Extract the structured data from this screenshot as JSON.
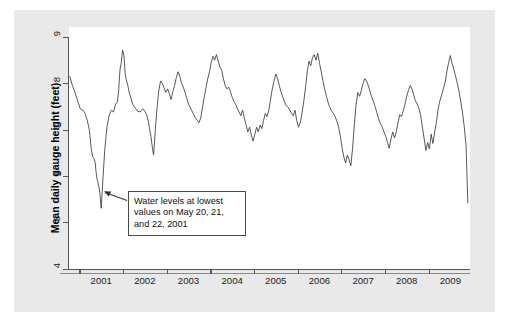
{
  "figure": {
    "background_color": "#e9e9e9",
    "plot_background_color": "#ffffff",
    "line_color": "#3a3a3a",
    "axis_color": "#555555"
  },
  "annotation": {
    "name": "lowest-values-callout",
    "line1": "Water levels at lowest",
    "line2": "values on May 20, 21,",
    "line3": "and 22, 2001",
    "full_text": "Water levels at lowest values on May 20, 21, and 22, 2001",
    "points_to_value": 5.3,
    "points_to_date": "2001-05-21"
  },
  "chart_data": {
    "type": "line",
    "title": "",
    "subtitle": "",
    "xlabel": "",
    "ylabel": "Mean daily gauge height (feet)",
    "ylim": [
      4,
      9
    ],
    "xlim": [
      2000.75,
      2009.95
    ],
    "ytick_labels": [
      "4",
      "5",
      "6",
      "7",
      "8",
      "9"
    ],
    "ytick_values": [
      4,
      5,
      6,
      7,
      8,
      9
    ],
    "xtick_labels": [
      "2001",
      "2002",
      "2003",
      "2004",
      "2005",
      "2006",
      "2007",
      "2008",
      "2009"
    ],
    "xtick_values": [
      2001,
      2002,
      2003,
      2004,
      2005,
      2006,
      2007,
      2008,
      2009
    ],
    "grid": false,
    "legend": "none",
    "series": [
      {
        "name": "Mean daily gauge height",
        "units": "feet",
        "x": [
          2000.78,
          2000.84,
          2000.9,
          2000.96,
          2001.02,
          2001.08,
          2001.13,
          2001.18,
          2001.23,
          2001.27,
          2001.3,
          2001.33,
          2001.36,
          2001.38,
          2001.4,
          2001.42,
          2001.45,
          2001.47,
          2001.5,
          2001.54,
          2001.58,
          2001.63,
          2001.68,
          2001.73,
          2001.78,
          2001.83,
          2001.87,
          2001.9,
          2001.93,
          2001.96,
          2001.99,
          2002.02,
          2002.05,
          2002.08,
          2002.11,
          2002.14,
          2002.18,
          2002.22,
          2002.27,
          2002.33,
          2002.39,
          2002.45,
          2002.5,
          2002.54,
          2002.58,
          2002.61,
          2002.64,
          2002.67,
          2002.7,
          2002.74,
          2002.78,
          2002.82,
          2002.86,
          2002.9,
          2002.94,
          2002.98,
          2003.02,
          2003.06,
          2003.1,
          2003.14,
          2003.18,
          2003.22,
          2003.26,
          2003.3,
          2003.34,
          2003.38,
          2003.42,
          2003.46,
          2003.5,
          2003.54,
          2003.58,
          2003.62,
          2003.66,
          2003.7,
          2003.74,
          2003.78,
          2003.82,
          2003.86,
          2003.9,
          2003.94,
          2003.98,
          2004.02,
          2004.06,
          2004.1,
          2004.14,
          2004.18,
          2004.22,
          2004.26,
          2004.3,
          2004.34,
          2004.38,
          2004.42,
          2004.46,
          2004.5,
          2004.54,
          2004.58,
          2004.62,
          2004.66,
          2004.7,
          2004.74,
          2004.78,
          2004.82,
          2004.86,
          2004.9,
          2004.94,
          2004.98,
          2005.02,
          2005.06,
          2005.1,
          2005.14,
          2005.18,
          2005.22,
          2005.26,
          2005.3,
          2005.34,
          2005.38,
          2005.42,
          2005.46,
          2005.5,
          2005.54,
          2005.58,
          2005.62,
          2005.66,
          2005.7,
          2005.74,
          2005.78,
          2005.82,
          2005.86,
          2005.9,
          2005.94,
          2005.98,
          2006.02,
          2006.06,
          2006.1,
          2006.14,
          2006.18,
          2006.22,
          2006.26,
          2006.3,
          2006.34,
          2006.38,
          2006.42,
          2006.46,
          2006.5,
          2006.54,
          2006.58,
          2006.62,
          2006.66,
          2006.7,
          2006.74,
          2006.78,
          2006.82,
          2006.86,
          2006.9,
          2006.94,
          2006.98,
          2007.02,
          2007.06,
          2007.1,
          2007.14,
          2007.18,
          2007.22,
          2007.26,
          2007.3,
          2007.34,
          2007.38,
          2007.42,
          2007.46,
          2007.5,
          2007.54,
          2007.58,
          2007.62,
          2007.66,
          2007.7,
          2007.74,
          2007.78,
          2007.82,
          2007.86,
          2007.9,
          2007.94,
          2007.98,
          2008.02,
          2008.06,
          2008.1,
          2008.14,
          2008.18,
          2008.22,
          2008.26,
          2008.3,
          2008.34,
          2008.38,
          2008.42,
          2008.46,
          2008.5,
          2008.54,
          2008.58,
          2008.62,
          2008.66,
          2008.7,
          2008.74,
          2008.78,
          2008.82,
          2008.86,
          2008.9,
          2008.94,
          2008.98,
          2009.02,
          2009.06,
          2009.1,
          2009.14,
          2009.18,
          2009.22,
          2009.26,
          2009.3,
          2009.34,
          2009.38,
          2009.42,
          2009.46,
          2009.5,
          2009.54,
          2009.58,
          2009.62,
          2009.66,
          2009.7,
          2009.74,
          2009.78,
          2009.82,
          2009.86,
          2009.9
        ],
        "y": [
          8.15,
          7.95,
          7.8,
          7.62,
          7.45,
          7.42,
          7.35,
          7.2,
          6.98,
          6.6,
          6.42,
          6.38,
          6.3,
          6.1,
          5.95,
          5.88,
          5.75,
          5.62,
          5.3,
          5.95,
          6.55,
          7.05,
          7.3,
          7.42,
          7.38,
          7.55,
          7.6,
          7.85,
          8.3,
          8.45,
          8.72,
          8.6,
          8.2,
          8.05,
          7.95,
          7.8,
          7.68,
          7.55,
          7.48,
          7.4,
          7.38,
          7.45,
          7.4,
          7.32,
          7.18,
          7.0,
          6.85,
          6.62,
          6.45,
          7.0,
          7.48,
          7.85,
          8.05,
          8.0,
          7.9,
          7.8,
          7.88,
          7.78,
          7.65,
          7.82,
          7.95,
          8.12,
          8.25,
          8.15,
          8.0,
          7.92,
          7.8,
          7.68,
          7.55,
          7.48,
          7.4,
          7.32,
          7.25,
          7.2,
          7.15,
          7.25,
          7.48,
          7.7,
          7.9,
          8.1,
          8.25,
          8.45,
          8.58,
          8.5,
          8.62,
          8.48,
          8.35,
          8.28,
          8.1,
          7.95,
          7.88,
          7.92,
          7.82,
          7.7,
          7.6,
          7.55,
          7.45,
          7.38,
          7.3,
          7.42,
          7.25,
          7.1,
          6.95,
          7.05,
          6.88,
          6.75,
          6.9,
          7.05,
          6.95,
          7.1,
          7.02,
          7.2,
          7.35,
          7.28,
          7.42,
          7.65,
          7.88,
          8.05,
          8.2,
          8.1,
          7.95,
          7.82,
          7.7,
          7.6,
          7.52,
          7.48,
          7.42,
          7.35,
          7.3,
          7.42,
          7.2,
          7.05,
          7.15,
          7.35,
          7.6,
          7.9,
          8.25,
          8.48,
          8.38,
          8.55,
          8.62,
          8.5,
          8.65,
          8.45,
          8.25,
          8.05,
          7.88,
          7.72,
          7.58,
          7.48,
          7.4,
          7.35,
          7.28,
          7.18,
          7.05,
          6.85,
          6.6,
          6.4,
          6.28,
          6.45,
          6.35,
          6.22,
          6.6,
          7.1,
          7.55,
          7.8,
          7.72,
          7.85,
          8.0,
          8.1,
          8.05,
          7.95,
          7.82,
          7.7,
          7.6,
          7.48,
          7.35,
          7.22,
          7.12,
          7.05,
          6.95,
          6.85,
          6.72,
          6.6,
          6.8,
          6.95,
          6.82,
          6.95,
          7.15,
          7.32,
          7.28,
          7.4,
          7.55,
          7.72,
          7.85,
          7.95,
          7.88,
          7.75,
          7.62,
          7.55,
          7.45,
          7.3,
          7.05,
          6.8,
          6.55,
          6.72,
          6.58,
          6.9,
          6.7,
          6.95,
          7.15,
          7.45,
          7.62,
          7.75,
          7.88,
          8.02,
          8.25,
          8.45,
          8.6,
          8.42,
          8.3,
          8.15,
          8.0,
          7.82,
          7.6,
          7.35,
          7.05,
          6.65,
          5.42
        ]
      }
    ]
  }
}
